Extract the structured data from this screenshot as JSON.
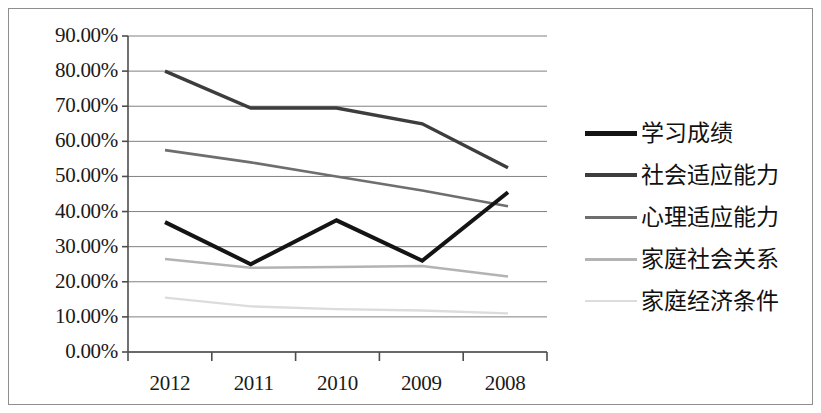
{
  "chart_data": {
    "type": "line",
    "title": "",
    "xlabel": "",
    "ylabel": "",
    "categories": [
      "2012",
      "2011",
      "2010",
      "2009",
      "2008"
    ],
    "ylim": [
      0,
      90
    ],
    "ytick_labels": [
      "90.00%",
      "80.00%",
      "70.00%",
      "60.00%",
      "50.00%",
      "40.00%",
      "30.00%",
      "20.00%",
      "10.00%",
      "0.00%"
    ],
    "ytick_values": [
      90,
      80,
      70,
      60,
      50,
      40,
      30,
      20,
      10,
      0
    ],
    "grid": true,
    "legend_position": "right",
    "series": [
      {
        "name": "学习成绩",
        "color": "#141414",
        "width": 4.0,
        "values": [
          37.0,
          25.0,
          37.5,
          26.0,
          45.5
        ]
      },
      {
        "name": "社会适应能力",
        "color": "#3d3d3d",
        "width": 3.4,
        "values": [
          80.0,
          69.5,
          69.5,
          65.0,
          52.5
        ]
      },
      {
        "name": "心理适应能力",
        "color": "#6e6e6e",
        "width": 2.6,
        "values": [
          57.5,
          54.0,
          50.0,
          46.0,
          41.5
        ]
      },
      {
        "name": "家庭社会关系",
        "color": "#b3b3b3",
        "width": 2.6,
        "values": [
          26.5,
          24.0,
          24.2,
          24.5,
          21.5
        ]
      },
      {
        "name": "家庭经济条件",
        "color": "#dcdcdc",
        "width": 2.4,
        "values": [
          15.5,
          13.0,
          12.2,
          11.8,
          11.0
        ]
      }
    ]
  },
  "axes": {
    "axis_color": "#4d4d4d",
    "grid_color": "#808080",
    "frame_color": "#8e8e8e"
  },
  "legend": {
    "entries": [
      {
        "label": "学习成绩",
        "color": "#141414",
        "width": 5
      },
      {
        "label": "社会适应能力",
        "color": "#3d3d3d",
        "width": 4
      },
      {
        "label": "心理适应能力",
        "color": "#6e6e6e",
        "width": 3
      },
      {
        "label": "家庭社会关系",
        "color": "#b3b3b3",
        "width": 3
      },
      {
        "label": "家庭经济条件",
        "color": "#dcdcdc",
        "width": 2
      }
    ]
  }
}
